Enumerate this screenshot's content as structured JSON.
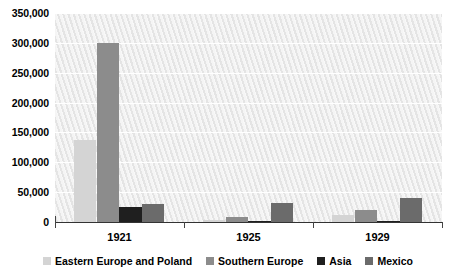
{
  "chart_data": {
    "type": "bar",
    "title": "",
    "subtitle": "",
    "xlabel": "",
    "ylabel": "",
    "categories": [
      "1921",
      "1925",
      "1929"
    ],
    "series": [
      {
        "name": "Eastern Europe and Poland",
        "color": "#d4d4d4",
        "values": [
          137000,
          4000,
          11000
        ]
      },
      {
        "name": "Southern Europe",
        "color": "#8c8c8c",
        "values": [
          300000,
          8000,
          20000
        ]
      },
      {
        "name": "Asia",
        "color": "#1f1f1f",
        "values": [
          25000,
          2000,
          2000
        ]
      },
      {
        "name": "Mexico",
        "color": "#6b6b6b",
        "values": [
          30000,
          32000,
          40000
        ]
      }
    ],
    "ylim": [
      0,
      350000
    ],
    "ytick_values": [
      0,
      50000,
      100000,
      150000,
      200000,
      250000,
      300000,
      350000
    ],
    "ytick_labels": [
      "0",
      "50,000",
      "100,000",
      "150,000",
      "200,000",
      "250,000",
      "300,000",
      "350,000"
    ],
    "grid": true,
    "grid_axis": "y",
    "legend_position": "bottom",
    "plot_background": "#f0f0f0",
    "gridline_color": "#ffffff",
    "axis_color": "#333333"
  }
}
